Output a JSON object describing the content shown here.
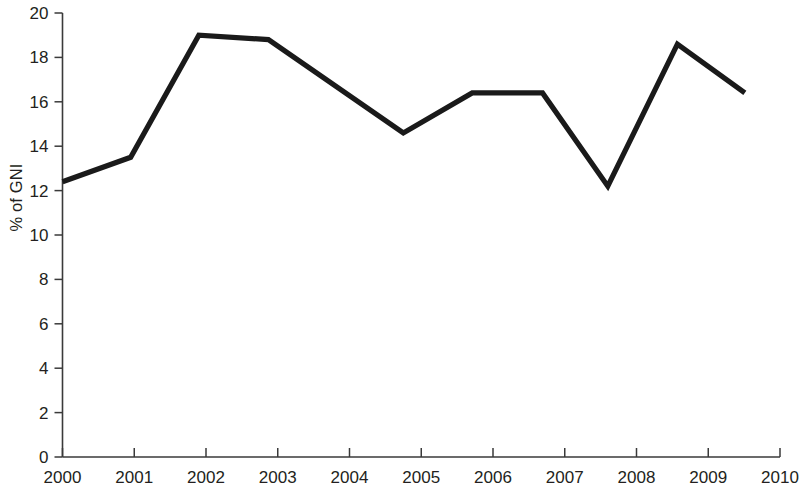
{
  "chart_data": {
    "type": "line",
    "title": "",
    "subtitle": "",
    "xlabel": "",
    "ylabel": "% of GNI",
    "xlim": [
      2000,
      2010
    ],
    "ylim": [
      0,
      20
    ],
    "x_ticks": [
      2000,
      2001,
      2002,
      2003,
      2004,
      2005,
      2006,
      2007,
      2008,
      2009,
      2010
    ],
    "x_tick_labels": [
      "2000",
      "2001",
      "2002",
      "2003",
      "2004",
      "2005",
      "2006",
      "2007",
      "2008",
      "2009",
      "2010"
    ],
    "y_ticks": [
      0,
      2,
      4,
      6,
      8,
      10,
      12,
      14,
      16,
      18,
      20
    ],
    "y_tick_labels": [
      "0",
      "2",
      "4",
      "6",
      "8",
      "10",
      "12",
      "14",
      "16",
      "18",
      "20"
    ],
    "grid": false,
    "legend": false,
    "legend_position": "none",
    "annotations": [],
    "line_color": "#1a1a1a",
    "background_color": "#ffffff",
    "axis_color": "#3a3a3a",
    "series": [
      {
        "name": "% of GNI",
        "color": "#1a1a1a",
        "x": [
          2000.0,
          2000.95,
          2001.9,
          2002.87,
          2004.75,
          2005.71,
          2006.69,
          2007.6,
          2008.57,
          2009.51
        ],
        "values": [
          12.4,
          13.5,
          19.0,
          18.8,
          14.6,
          16.4,
          16.4,
          12.2,
          18.6,
          16.4
        ]
      }
    ]
  }
}
